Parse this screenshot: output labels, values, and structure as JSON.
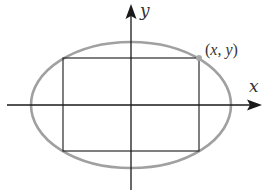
{
  "diagram": {
    "axes": {
      "x_label": "x",
      "y_label": "y"
    },
    "point": {
      "label_open": "(",
      "label_x": "x",
      "label_sep": ", ",
      "label_y": "y",
      "label_close": ")"
    },
    "colors": {
      "axis": "#1a1a1a",
      "ellipse": "#a0a0a0",
      "rectangle": "#2a2a2a",
      "point": "#a8a8a8",
      "text": "#333333"
    },
    "geometry": {
      "origin": [
        131,
        105
      ],
      "ellipse_rx": 100,
      "ellipse_ry": 63,
      "rectangle": {
        "left": 63,
        "top": 58,
        "right": 199,
        "bottom": 151
      },
      "point": [
        199,
        58
      ]
    }
  }
}
